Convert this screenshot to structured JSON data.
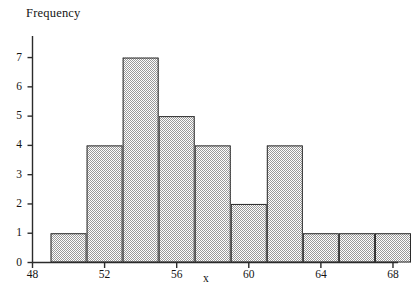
{
  "chart_data": {
    "type": "bar",
    "title": "",
    "subtitle": "",
    "ylabel": "Frequency",
    "xlabel": "x",
    "grid": false,
    "legend": null,
    "bar_style": {
      "fill": "#c9c9c9",
      "pattern": "checkered-dither",
      "edge_color": "#2b2b2b",
      "edge_width": 1
    },
    "axis_color": "#2b2b2b",
    "background": "#ffffff",
    "xlim": [
      48,
      69
    ],
    "ylim": [
      0,
      7.6
    ],
    "xticks": [
      48,
      52,
      56,
      60,
      64,
      68
    ],
    "xtick_labels": [
      "48",
      "52",
      "56",
      "60",
      "64",
      "68"
    ],
    "yticks": [
      0,
      1,
      2,
      3,
      4,
      5,
      6,
      7
    ],
    "ytick_labels": [
      "0",
      "1",
      "2",
      "3",
      "4",
      "5",
      "6",
      "7"
    ],
    "bin_width": 2,
    "bin_edges": [
      49,
      51,
      53,
      55,
      57,
      59,
      61,
      63,
      65,
      67,
      69
    ],
    "categories": [
      "49-51",
      "51-53",
      "53-55",
      "55-57",
      "57-59",
      "59-61",
      "61-63",
      "63-65",
      "65-67",
      "67-69"
    ],
    "values": [
      1,
      4,
      7,
      5,
      4,
      2,
      4,
      1,
      1,
      1
    ],
    "bars": [
      {
        "x0": 49,
        "x1": 51,
        "frequency": 1
      },
      {
        "x0": 51,
        "x1": 53,
        "frequency": 4
      },
      {
        "x0": 53,
        "x1": 55,
        "frequency": 7
      },
      {
        "x0": 55,
        "x1": 57,
        "frequency": 5
      },
      {
        "x0": 57,
        "x1": 59,
        "frequency": 4
      },
      {
        "x0": 59,
        "x1": 61,
        "frequency": 2
      },
      {
        "x0": 61,
        "x1": 63,
        "frequency": 4
      },
      {
        "x0": 63,
        "x1": 65,
        "frequency": 1
      },
      {
        "x0": 65,
        "x1": 67,
        "frequency": 1
      },
      {
        "x0": 67,
        "x1": 69,
        "frequency": 1
      }
    ],
    "total_count": 30
  }
}
